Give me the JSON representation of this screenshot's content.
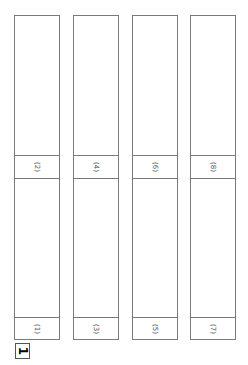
{
  "columns": [
    {
      "top_label": "(2)",
      "bottom_label": "(1)"
    },
    {
      "top_label": "(4)",
      "bottom_label": "(3)"
    },
    {
      "top_label": "(6)",
      "bottom_label": "(5)"
    },
    {
      "top_label": "(8)",
      "bottom_label": "(7)"
    }
  ],
  "badge": {
    "label": "1"
  },
  "colors": {
    "stroke": "#7a7a7a",
    "background": "#ffffff"
  }
}
